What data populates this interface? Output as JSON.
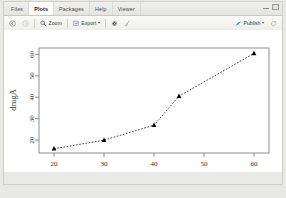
{
  "window": {
    "minimize_icon": "minimize-icon",
    "maximize_icon": "maximize-icon"
  },
  "tabs": [
    {
      "label": "Files",
      "active": false
    },
    {
      "label": "Plots",
      "active": true
    },
    {
      "label": "Packages",
      "active": false
    },
    {
      "label": "Help",
      "active": false
    },
    {
      "label": "Viewer",
      "active": false
    }
  ],
  "toolbar": {
    "back_icon": "back-arrow-icon",
    "forward_icon": "forward-arrow-icon",
    "zoom_label": "Zoom",
    "zoom_icon": "magnifier-icon",
    "export_label": "Export",
    "export_icon": "export-icon",
    "export_caret": "▾",
    "remove_icon": "remove-plot-icon",
    "clear_all_icon": "broom-icon",
    "publish_label": "Publish",
    "publish_icon": "publish-icon",
    "publish_caret": "▾",
    "refresh_icon": "refresh-icon"
  },
  "chart_data": {
    "type": "line",
    "title": "",
    "xlabel": "dose",
    "ylabel": "drugA",
    "x": [
      20,
      30,
      40,
      45,
      60
    ],
    "values": [
      16,
      20,
      27,
      40.5,
      60.5
    ],
    "xlim": [
      17,
      63
    ],
    "ylim": [
      14,
      63
    ],
    "xticks": [
      20,
      30,
      40,
      50,
      60
    ],
    "yticks": [
      20,
      30,
      40,
      50,
      60
    ],
    "grid": false,
    "legend": "none",
    "line_style": "dotted",
    "marker": "triangle",
    "marker_color": "#000000",
    "line_color": "#3a3a3a",
    "box": true
  }
}
